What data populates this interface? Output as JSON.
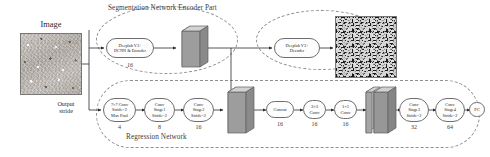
{
  "diagram": {
    "title_segmentation": "Segmentation Network Encoder Part",
    "title_regression": "Regression Network",
    "input_label": "Image",
    "output_stride_label": "Output\nstride"
  },
  "segmentation_branch": {
    "encoder_node": "Deeplab V3+\nDCNN & Encoder",
    "encoder_channels": "16",
    "decoder_node": "Deeplab V3+\nDecoder"
  },
  "regression_branch": {
    "nodes": [
      {
        "label": "7×7 Conv\nStride=2\nMax Pool",
        "channels": "4"
      },
      {
        "label": "Conv\nStage1\nStride=2",
        "channels": "8"
      },
      {
        "label": "Conv\nStage2\nStride=2",
        "channels": "16"
      },
      {
        "label": "Concat",
        "channels": "16"
      },
      {
        "label": "3×3\nConv",
        "channels": "16"
      },
      {
        "label": "1×1\nConv",
        "channels": "16"
      },
      {
        "label": "Conv\nStage3\nStride=2",
        "channels": "32"
      },
      {
        "label": "Conv\nStage4\nStride=2",
        "channels": "64"
      },
      {
        "label": "FC",
        "channels": ""
      }
    ]
  },
  "images": {
    "input_texture_name": "input-image-texture",
    "output_texture_name": "segmentation-output-texture"
  },
  "feature_maps": [
    {
      "name": "encoder-feature-map"
    },
    {
      "name": "regression-feature-map"
    },
    {
      "name": "fused-feature-map"
    }
  ],
  "colors": {
    "stroke": "#6d6d6d",
    "dashed": "#8f8f8f",
    "text": "#2b2b2b",
    "slab_face": "#9a9a9a",
    "slab_side": "#bdbdbd"
  }
}
